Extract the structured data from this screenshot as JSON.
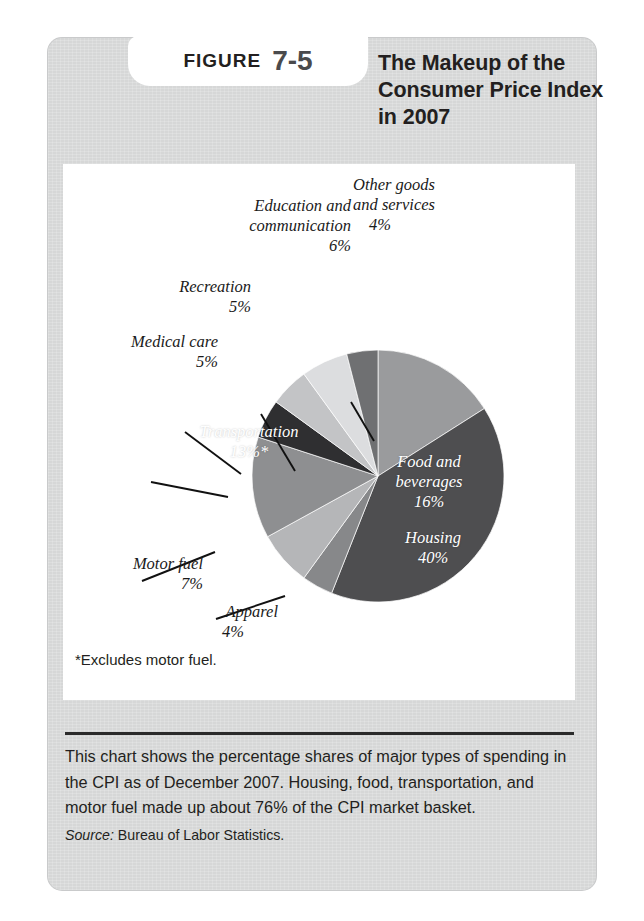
{
  "figure": {
    "label": "FIGURE",
    "number": "7-5",
    "title": "The Makeup of the Consumer Price Index in 2007",
    "footnote": "*Excludes motor fuel.",
    "caption": "This chart shows the percentage shares of major types of spending in the CPI as of December 2007. Housing, food, transportation, and motor fuel made up about 76% of the CPI market basket.",
    "source_label": "Source:",
    "source_text": "Bureau of Labor Statistics."
  },
  "chart_data": {
    "type": "pie",
    "title": "The Makeup of the Consumer Price Index in 2007",
    "unit": "percent",
    "total": 100,
    "start_angle_deg": 0,
    "direction": "clockwise",
    "legend": "none (direct labels)",
    "categories": [
      "Food and beverages",
      "Housing",
      "Apparel",
      "Motor fuel",
      "Transportation",
      "Medical care",
      "Recreation",
      "Education and communication",
      "Other goods and services"
    ],
    "values": [
      16,
      40,
      4,
      7,
      13,
      5,
      5,
      6,
      4
    ],
    "slices": [
      {
        "name": "Food and beverages",
        "value": 16,
        "label": "Food and beverages",
        "value_label": "16%",
        "color": "#9a9b9d",
        "label_placement": "inside",
        "label_color": "#ffffff"
      },
      {
        "name": "Housing",
        "value": 40,
        "label": "Housing",
        "value_label": "40%",
        "color": "#4e4e50",
        "label_placement": "inside",
        "label_color": "#ffffff"
      },
      {
        "name": "Apparel",
        "value": 4,
        "label": "Apparel",
        "value_label": "4%",
        "color": "#87888a",
        "label_placement": "outside",
        "label_color": "#1a1a1a"
      },
      {
        "name": "Motor fuel",
        "value": 7,
        "label": "Motor fuel",
        "value_label": "7%",
        "color": "#b5b6b8",
        "label_placement": "outside",
        "label_color": "#1a1a1a"
      },
      {
        "name": "Transportation",
        "value": 13,
        "label": "Transportation",
        "value_label": "13%*",
        "color": "#8e8f91",
        "label_placement": "inside",
        "label_color": "#ffffff"
      },
      {
        "name": "Medical care",
        "value": 5,
        "label": "Medical care",
        "value_label": "5%",
        "color": "#2f2f31",
        "label_placement": "outside",
        "label_color": "#1a1a1a"
      },
      {
        "name": "Recreation",
        "value": 5,
        "label": "Recreation",
        "value_label": "5%",
        "color": "#c3c4c6",
        "label_placement": "outside",
        "label_color": "#1a1a1a"
      },
      {
        "name": "Education and communication",
        "value": 6,
        "label": "Education and communication",
        "value_label": "6%",
        "color": "#dcdddf",
        "label_placement": "outside",
        "label_color": "#1a1a1a"
      },
      {
        "name": "Other goods and services",
        "value": 4,
        "label": "Other goods and services",
        "value_label": "4%",
        "color": "#6f7072",
        "label_placement": "outside",
        "label_color": "#1a1a1a"
      }
    ],
    "notes": [
      "*Excludes motor fuel."
    ]
  },
  "labels": {
    "food_name_1": "Food and",
    "food_name_2": "beverages",
    "food_pct": "16%",
    "housing_name": "Housing",
    "housing_pct": "40%",
    "transportation_name": "Transportation",
    "transportation_pct": "13%*",
    "other_line1": "Other goods",
    "other_line2": "and services",
    "other_pct": "4%",
    "education_line1": "Education and",
    "education_line2": "communication",
    "education_pct": "6%",
    "recreation_name": "Recreation",
    "recreation_pct": "5%",
    "medical_name": "Medical care",
    "medical_pct": "5%",
    "motorfuel_name": "Motor fuel",
    "motorfuel_pct": "7%",
    "apparel_name": "Apparel",
    "apparel_pct": "4%"
  }
}
